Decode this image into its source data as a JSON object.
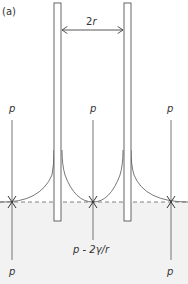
{
  "figure": {
    "panel_label": "(a)",
    "width_label_prefix": "2",
    "width_label_var": "r",
    "pressure_outside_top_left": "p",
    "pressure_outside_top_mid": "p",
    "pressure_outside_top_right": "p",
    "pressure_inside": "p - 2γ/r",
    "pressure_bottom_left": "p",
    "pressure_bottom_right": "p"
  },
  "colors": {
    "line": "#555555",
    "liquid_fill": "#f2f2f2",
    "background": "#ffffff"
  }
}
